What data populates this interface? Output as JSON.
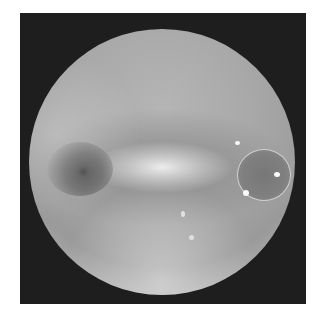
{
  "image": {
    "type": "fundus-photograph",
    "colors": {
      "background": "#ffffff",
      "frame": "#1e1e1e",
      "retina": "#a8a8a8"
    }
  }
}
